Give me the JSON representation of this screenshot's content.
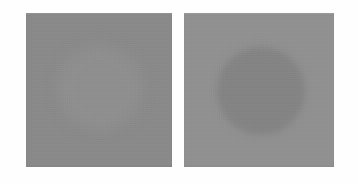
{
  "scene": {
    "title": "Brightness contrast stimulus pair",
    "canvas_width": 358,
    "canvas_height": 184,
    "page_background": "#fefefe"
  },
  "panels": [
    {
      "name": "left-stimulus",
      "label": "Left stimulus square",
      "x": 26,
      "y": 13,
      "width": 146,
      "height": 154,
      "background_color": "#8a8a8a",
      "disc": {
        "name": "low-contrast-disc",
        "label": "Faint lighter disc",
        "center_x": 100,
        "center_y": 88,
        "radius": 43,
        "color": "#8f8f8f",
        "contrast": "low",
        "polarity": "lighter-than-background",
        "edge": "soft"
      }
    },
    {
      "name": "right-stimulus",
      "label": "Right stimulus square",
      "x": 184,
      "y": 13,
      "width": 150,
      "height": 154,
      "background_color": "#919191",
      "disc": {
        "name": "high-contrast-disc",
        "label": "Visible darker disc",
        "center_x": 261,
        "center_y": 91,
        "radius": 44,
        "color": "#848484",
        "contrast": "high",
        "polarity": "darker-than-background",
        "edge": "soft"
      }
    }
  ]
}
